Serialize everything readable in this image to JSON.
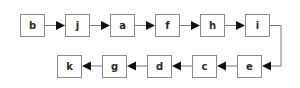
{
  "diagram": {
    "type": "linked-chain",
    "colors": {
      "box_stroke": "#8a8a8a",
      "edge": "#777777",
      "arrowhead": "#111111",
      "text": "#2a2a2a"
    },
    "top_row": [
      {
        "id": "b",
        "label": "b"
      },
      {
        "id": "j",
        "label": "j"
      },
      {
        "id": "a",
        "label": "a"
      },
      {
        "id": "f",
        "label": "f"
      },
      {
        "id": "h",
        "label": "h"
      },
      {
        "id": "i",
        "label": "i"
      }
    ],
    "bottom_row": [
      {
        "id": "k",
        "label": "k"
      },
      {
        "id": "g",
        "label": "g"
      },
      {
        "id": "d",
        "label": "d"
      },
      {
        "id": "c",
        "label": "c"
      },
      {
        "id": "e",
        "label": "e"
      }
    ],
    "edges": [
      {
        "from": "b",
        "to": "j"
      },
      {
        "from": "j",
        "to": "a"
      },
      {
        "from": "a",
        "to": "f"
      },
      {
        "from": "f",
        "to": "h"
      },
      {
        "from": "h",
        "to": "i"
      },
      {
        "from": "i",
        "to": "e"
      },
      {
        "from": "e",
        "to": "c"
      },
      {
        "from": "c",
        "to": "d"
      },
      {
        "from": "d",
        "to": "g"
      },
      {
        "from": "g",
        "to": "k"
      }
    ]
  }
}
